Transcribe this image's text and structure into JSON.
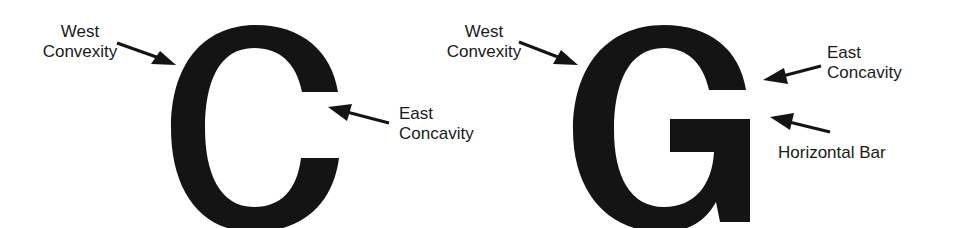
{
  "figure": {
    "ink_color": "#141414",
    "background": "#ffffff",
    "letters": [
      {
        "glyph": "C",
        "labels": {
          "west": {
            "line1": "West",
            "line2": "Convexity"
          },
          "east": {
            "line1": "East",
            "line2": "Concavity"
          }
        }
      },
      {
        "glyph": "G",
        "labels": {
          "west": {
            "line1": "West",
            "line2": "Convexity"
          },
          "east": {
            "line1": "East",
            "line2": "Concavity"
          },
          "bar": {
            "line1": "Horizontal Bar"
          }
        }
      }
    ]
  }
}
